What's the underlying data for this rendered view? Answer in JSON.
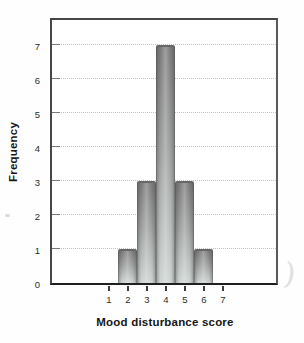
{
  "chart_data": {
    "type": "bar",
    "title": "",
    "xlabel": "Mood disturbance score",
    "ylabel": "Frequency",
    "x": [
      1,
      2,
      3,
      4,
      5,
      6,
      7
    ],
    "values": [
      0,
      1,
      3,
      7,
      3,
      1,
      0
    ],
    "yticks": [
      0,
      1,
      2,
      3,
      4,
      5,
      6,
      7
    ],
    "ylim": [
      0,
      7.8
    ],
    "xlim": [
      0.5,
      9.9
    ],
    "bar_width_units": 1,
    "grid": "horizontal-dotted",
    "legend": "none"
  },
  "colors": {
    "bar_top": "#787878",
    "bar_bottom": "#ccd3d0",
    "bar_edge": "#676767",
    "gridline": "#c3c3c3",
    "frame": "#474747",
    "axis_bottom": "#1f1f1f",
    "text": "#2c2c2c",
    "background": "#fefefe"
  },
  "artifacts": {
    "margin_mark_glyph": ")"
  }
}
